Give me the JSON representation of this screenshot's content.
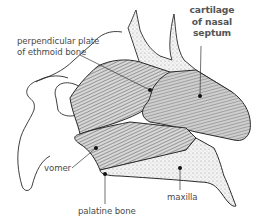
{
  "diagram": {
    "labels": [
      {
        "id": "perpendicular_plate",
        "lines": [
          "perpendicular plate",
          "of ethmoid bone"
        ],
        "bold": false
      },
      {
        "id": "cartilage_septum",
        "lines": [
          "cartilage",
          "of nasal",
          "septum"
        ],
        "bold": true
      },
      {
        "id": "vomer",
        "lines": [
          "vomer"
        ],
        "bold": false
      },
      {
        "id": "palatine_bone",
        "lines": [
          "palatine bone"
        ],
        "bold": false
      },
      {
        "id": "maxilla",
        "lines": [
          "maxilla"
        ],
        "bold": false
      }
    ],
    "colors": {
      "outline": "#2a2a2a",
      "shading_dark": "#6e6e6e",
      "shading_mid": "#9a9a9a",
      "shading_light": "#cfcfcf",
      "label_text": "#4a4a4a",
      "background": "#ffffff"
    }
  }
}
